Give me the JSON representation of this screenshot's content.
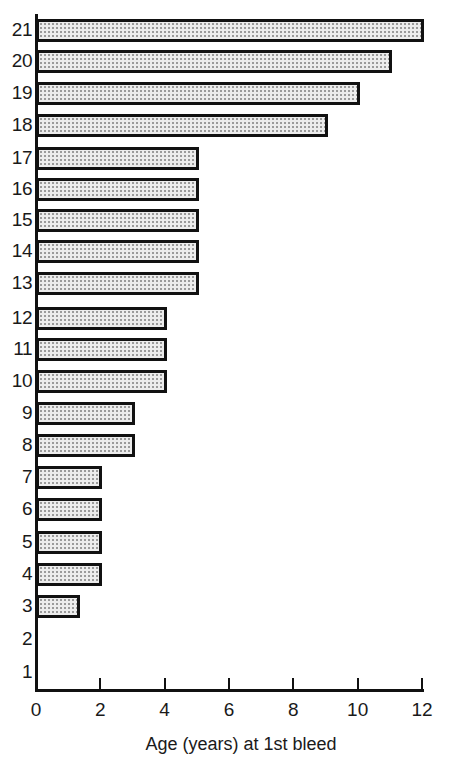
{
  "chart_data": {
    "type": "bar",
    "orientation": "horizontal",
    "title": "",
    "xlabel": "Age (years) at 1st bleed",
    "ylabel": "",
    "categories": [
      "1",
      "2",
      "3",
      "4",
      "5",
      "6",
      "7",
      "8",
      "9",
      "10",
      "11",
      "12",
      "13",
      "14",
      "15",
      "16",
      "17",
      "18",
      "19",
      "20",
      "21"
    ],
    "values": [
      0,
      0,
      1.3,
      2,
      2,
      2,
      2,
      3,
      3,
      4,
      4,
      4,
      5,
      5,
      5,
      5,
      5,
      9,
      10,
      11,
      12
    ],
    "xlim": [
      0,
      12
    ],
    "xticks": [
      "0",
      "2",
      "4",
      "6",
      "8",
      "10",
      "12"
    ],
    "grid": false,
    "legend": null,
    "bar_fill": "stippled light gray",
    "bar_edge_color": "#111111"
  },
  "axis": {
    "x_title": "Age (years) at 1st bleed",
    "x_tick_labels": [
      "0",
      "2",
      "4",
      "6",
      "8",
      "10",
      "12"
    ]
  }
}
